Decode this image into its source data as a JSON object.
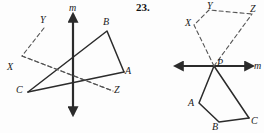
{
  "problem": {
    "number": "23."
  },
  "colors": {
    "ink": "#1a1a1a",
    "solid_stroke": "#2b2b2b",
    "dashed_stroke": "#555555",
    "page_background": "#fdfdfd"
  },
  "figures": [
    {
      "id": "left-figure",
      "name": "reflection-over-vertical-line-m",
      "line": {
        "label": "m",
        "orientation": "vertical",
        "arrows": "both",
        "x1": 73,
        "y1": 14,
        "x2": 73,
        "y2": 115,
        "label_x": 69,
        "label_y": 3
      },
      "solid_shape": {
        "name": "triangle-CBA",
        "points": "28,92 107,31 124,72",
        "closed": false,
        "vertices": [
          {
            "label": "C",
            "x": 28,
            "y": 92,
            "label_x": 16,
            "label_y": 85
          },
          {
            "label": "B",
            "x": 107,
            "y": 31,
            "label_x": 103,
            "label_y": 17
          },
          {
            "label": "A",
            "x": 124,
            "y": 72,
            "label_x": 125,
            "label_y": 66
          }
        ]
      },
      "dashed_shape": {
        "name": "triangle-YXZ",
        "points": "44,28 22,56 113,91",
        "closed": false,
        "vertices": [
          {
            "label": "Y",
            "x": 44,
            "y": 28,
            "label_x": 40,
            "label_y": 15
          },
          {
            "label": "X",
            "x": 22,
            "y": 56,
            "label_x": 7,
            "label_y": 62
          },
          {
            "label": "Z",
            "x": 113,
            "y": 91,
            "label_x": 114,
            "label_y": 85
          }
        ]
      },
      "connectors": [
        {
          "name": "segment-C-to-A",
          "x1": 28,
          "y1": 92,
          "x2": 124,
          "y2": 72,
          "style": "solid"
        },
        {
          "name": "segment-X-to-Z",
          "x1": 22,
          "y1": 56,
          "x2": 113,
          "y2": 91,
          "style": "dashed"
        }
      ]
    },
    {
      "id": "right-figure",
      "name": "reflection-over-horizontal-line-m-through-P",
      "line": {
        "label": "m",
        "orientation": "horizontal",
        "arrows": "both",
        "x1": 175,
        "y1": 66,
        "x2": 253,
        "y2": 66,
        "label_x": 254,
        "label_y": 61
      },
      "point_label": {
        "label": "P",
        "x": 214,
        "y": 66,
        "label_x": 217,
        "label_y": 58
      },
      "solid_shape": {
        "name": "quadrilateral-PABC",
        "points": "214,66 199,103 219,122 249,118",
        "closed": false,
        "vertices": [
          {
            "label": "A",
            "x": 199,
            "y": 103,
            "label_x": 188,
            "label_y": 98
          },
          {
            "label": "B",
            "x": 219,
            "y": 122,
            "label_x": 212,
            "label_y": 122
          },
          {
            "label": "C",
            "x": 249,
            "y": 118,
            "label_x": 251,
            "label_y": 116
          }
        ]
      },
      "dashed_shape": {
        "name": "quadrilateral-PXYZ",
        "points": "214,66 194,25 209,10 252,14",
        "closed": false,
        "vertices": [
          {
            "label": "X",
            "x": 194,
            "y": 25,
            "label_x": 185,
            "label_y": 18
          },
          {
            "label": "Y",
            "x": 209,
            "y": 10,
            "label_x": 207,
            "label_y": 1
          },
          {
            "label": "Z",
            "x": 252,
            "y": 14,
            "label_x": 250,
            "label_y": 4
          }
        ]
      },
      "connectors": [
        {
          "name": "segment-P-to-C",
          "x1": 214,
          "y1": 66,
          "x2": 249,
          "y2": 118,
          "style": "solid"
        },
        {
          "name": "segment-P-to-Z",
          "x1": 214,
          "y1": 66,
          "x2": 252,
          "y2": 14,
          "style": "dashed"
        }
      ]
    }
  ]
}
